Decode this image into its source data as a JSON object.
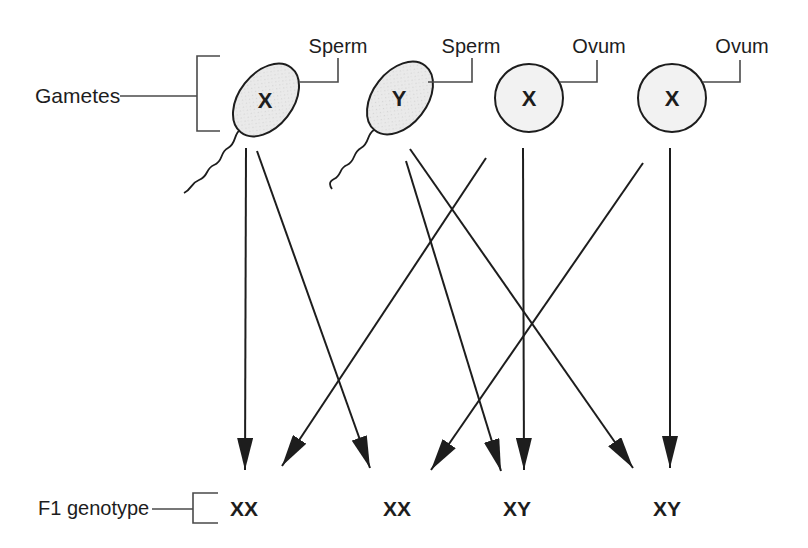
{
  "figure": {
    "gametes_label": "Gametes",
    "f1_label": "F1 genotype",
    "cells": [
      {
        "id": "sperm-x",
        "kind": "Sperm",
        "chromosome": "X"
      },
      {
        "id": "sperm-y",
        "kind": "Sperm",
        "chromosome": "Y"
      },
      {
        "id": "ovum-1",
        "kind": "Ovum",
        "chromosome": "X"
      },
      {
        "id": "ovum-2",
        "kind": "Ovum",
        "chromosome": "X"
      }
    ],
    "f1_genotypes": [
      {
        "id": "f1-1",
        "label": "XX"
      },
      {
        "id": "f1-2",
        "label": "XX"
      },
      {
        "id": "f1-3",
        "label": "XY"
      },
      {
        "id": "f1-4",
        "label": "XY"
      }
    ],
    "crosses": [
      {
        "from": "sperm-x",
        "to": "f1-1",
        "x1": 246,
        "y1": 148,
        "x2": 245,
        "y2": 470
      },
      {
        "from": "sperm-x",
        "to": "f1-2",
        "x1": 257,
        "y1": 151,
        "x2": 370,
        "y2": 468
      },
      {
        "from": "sperm-y",
        "to": "f1-3",
        "x1": 406,
        "y1": 161,
        "x2": 501,
        "y2": 471
      },
      {
        "from": "sperm-y",
        "to": "f1-4",
        "x1": 410,
        "y1": 149,
        "x2": 633,
        "y2": 468
      },
      {
        "from": "ovum-1",
        "to": "f1-1",
        "x1": 486,
        "y1": 158,
        "x2": 282,
        "y2": 466
      },
      {
        "from": "ovum-1",
        "to": "f1-3",
        "x1": 523,
        "y1": 148,
        "x2": 524,
        "y2": 470
      },
      {
        "from": "ovum-2",
        "to": "f1-2",
        "x1": 643,
        "y1": 163,
        "x2": 431,
        "y2": 470
      },
      {
        "from": "ovum-2",
        "to": "f1-4",
        "x1": 670,
        "y1": 148,
        "x2": 670,
        "y2": 468
      }
    ],
    "colors": {
      "paper": "#ffffff",
      "ink": "#1d1d1d",
      "line": "#4a4a4a",
      "sperm_fill": "#eaeaea",
      "stipple_dot": "#d2d2d2",
      "ovum_fill": "#f2f2f2"
    }
  }
}
